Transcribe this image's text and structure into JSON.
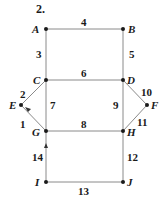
{
  "problem_number": "2.",
  "nodes": {
    "A": {
      "label": "A",
      "x": 46,
      "y": 29
    },
    "B": {
      "label": "B",
      "x": 123,
      "y": 29
    },
    "C": {
      "label": "C",
      "x": 46,
      "y": 80
    },
    "D": {
      "label": "D",
      "x": 123,
      "y": 80
    },
    "E": {
      "label": "E",
      "x": 21,
      "y": 105
    },
    "F": {
      "label": "F",
      "x": 147,
      "y": 105
    },
    "G": {
      "label": "G",
      "x": 46,
      "y": 131
    },
    "H": {
      "label": "H",
      "x": 123,
      "y": 131
    },
    "I": {
      "label": "I",
      "x": 46,
      "y": 182
    },
    "J": {
      "label": "J",
      "x": 123,
      "y": 182
    }
  },
  "edges": [
    {
      "label": "1",
      "from": "G",
      "to": "E",
      "arrow": true
    },
    {
      "label": "2",
      "from": "C",
      "to": "E"
    },
    {
      "label": "3",
      "from": "A",
      "to": "C"
    },
    {
      "label": "4",
      "from": "A",
      "to": "B"
    },
    {
      "label": "5",
      "from": "B",
      "to": "D"
    },
    {
      "label": "6",
      "from": "C",
      "to": "D"
    },
    {
      "label": "7",
      "from": "C",
      "to": "G"
    },
    {
      "label": "8",
      "from": "G",
      "to": "H"
    },
    {
      "label": "9",
      "from": "D",
      "to": "H"
    },
    {
      "label": "10",
      "from": "D",
      "to": "F"
    },
    {
      "label": "11",
      "from": "H",
      "to": "F"
    },
    {
      "label": "12",
      "from": "H",
      "to": "J"
    },
    {
      "label": "13",
      "from": "I",
      "to": "J"
    },
    {
      "label": "14",
      "from": "I",
      "to": "G",
      "arrow": true
    }
  ],
  "colors": {
    "line": "#8a8a8a",
    "node": "#1a1a1a",
    "text": "#1a1a1a"
  }
}
